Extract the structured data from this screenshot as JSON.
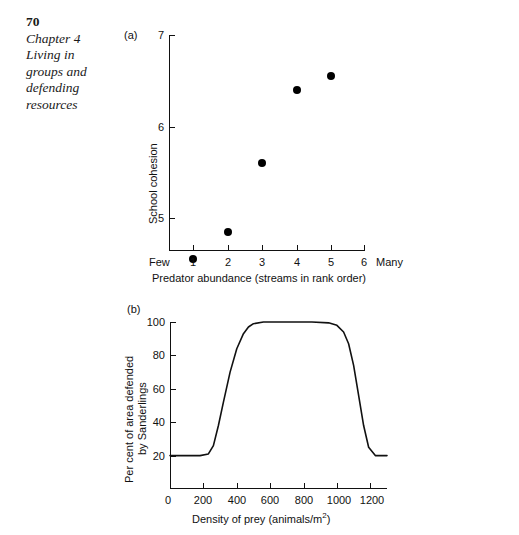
{
  "page": {
    "folio": "70",
    "running_head_lines": [
      "Chapter 4",
      "Living in",
      "groups and",
      "defending",
      "resources"
    ]
  },
  "figures": [
    {
      "panel_label": "(a)",
      "chart_data": {
        "type": "scatter",
        "title": "",
        "xlabel": "Predator abundance (streams in rank order)",
        "ylabel": "School cohesion",
        "x": [
          1,
          2,
          3,
          4,
          5
        ],
        "y": [
          4.55,
          4.85,
          5.6,
          6.4,
          6.55
        ],
        "xticks": [
          1,
          2,
          3,
          4,
          5,
          6
        ],
        "xtick_labels": [
          "1",
          "2",
          "3",
          "4",
          "5",
          "6"
        ],
        "yticks": [
          5,
          6,
          7
        ],
        "ytick_labels": [
          "5",
          "6",
          "7"
        ],
        "xlim": [
          0.55,
          6.35
        ],
        "ylim": [
          4.35,
          7.0
        ],
        "x_axis_left_endcap": "Few",
        "x_axis_right_endcap": "Many",
        "grid": false,
        "legend": "none",
        "marker": "filled-circle"
      }
    },
    {
      "panel_label": "(b)",
      "chart_data": {
        "type": "line",
        "title": "",
        "xlabel": "Density of prey (animals/m2)",
        "xlabel_base": "Density of prey (animals/m",
        "xlabel_sup": "2",
        "xlabel_tail": ")",
        "ylabel_line1": "Per cent of area defended",
        "ylabel_line2": "by Sanderlings",
        "xticks": [
          0,
          200,
          400,
          600,
          800,
          1000,
          1200
        ],
        "xtick_labels": [
          "0",
          "200",
          "400",
          "600",
          "800",
          "1000",
          "1200"
        ],
        "yticks": [
          20,
          40,
          60,
          80,
          100
        ],
        "ytick_labels": [
          "20",
          "40",
          "60",
          "80",
          "100"
        ],
        "xlim": [
          0,
          1300
        ],
        "ylim": [
          0,
          105
        ],
        "grid": false,
        "legend": "none",
        "x": [
          0,
          100,
          180,
          230,
          260,
          290,
          320,
          360,
          400,
          440,
          470,
          500,
          560,
          700,
          850,
          950,
          1000,
          1040,
          1070,
          1100,
          1130,
          1160,
          1190,
          1230,
          1300
        ],
        "y": [
          20,
          20,
          20,
          21,
          26,
          38,
          52,
          70,
          84,
          93,
          97,
          99,
          100,
          100,
          100,
          99.5,
          98,
          94,
          87,
          74,
          56,
          38,
          25,
          20,
          20
        ]
      }
    }
  ]
}
